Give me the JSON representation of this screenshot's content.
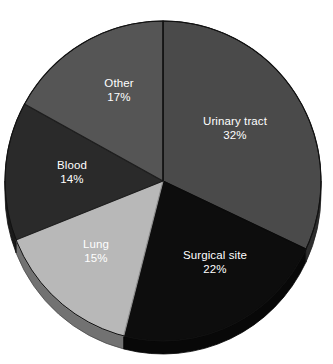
{
  "chart_data": {
    "type": "pie",
    "title": "",
    "subtitle": "",
    "xlabel": "",
    "ylabel": "",
    "legend_position": "none",
    "grid": false,
    "labels_inside_slices": true,
    "value_format": "percent",
    "start_angle_deg": 0,
    "direction": "clockwise",
    "style": "3d",
    "categories": [
      "Urinary tract",
      "Surgical site",
      "Lung",
      "Blood",
      "Other"
    ],
    "values": [
      32,
      22,
      15,
      14,
      17
    ],
    "value_labels": [
      "32%",
      "22%",
      "15%",
      "14%",
      "17%"
    ],
    "colors": [
      "#4a4a4a",
      "#0d0d0d",
      "#b8b8b8",
      "#2a2a2a",
      "#555555"
    ],
    "slices": [
      {
        "name": "Urinary tract",
        "value": 32,
        "value_label": "32%",
        "color": "#4a4a4a",
        "label_x": 235,
        "label_y": 128,
        "start_deg": 0,
        "end_deg": 115.2
      },
      {
        "name": "Surgical site",
        "value": 22,
        "value_label": "22%",
        "color": "#0d0d0d",
        "label_x": 215,
        "label_y": 262,
        "start_deg": 115.2,
        "end_deg": 194.4
      },
      {
        "name": "Lung",
        "value": 15,
        "value_label": "15%",
        "color": "#b8b8b8",
        "label_x": 96,
        "label_y": 251,
        "start_deg": 194.4,
        "end_deg": 248.4
      },
      {
        "name": "Blood",
        "value": 14,
        "value_label": "14%",
        "color": "#2a2a2a",
        "label_x": 72,
        "label_y": 172,
        "start_deg": 248.4,
        "end_deg": 298.8
      },
      {
        "name": "Other",
        "value": 17,
        "value_label": "17%",
        "color": "#555555",
        "label_x": 119,
        "label_y": 90,
        "start_deg": 298.8,
        "end_deg": 360
      }
    ]
  },
  "geometry": {
    "center_x": 163,
    "center_y": 181,
    "radius_x": 158,
    "radius_y": 160,
    "depth": 13,
    "background": "#ffffff",
    "divider_color": "#111111",
    "rim_shadow_color": "#6e6e6e",
    "rim_dark_color": "#3d3d3d",
    "label_color": "#ffffff"
  }
}
